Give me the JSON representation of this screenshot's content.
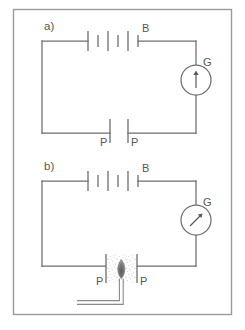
{
  "figure": {
    "type": "physics-circuit-diagram",
    "frame_color": "#9a9a9a",
    "wire_color": "#6e6e6e",
    "label_color": "#565656",
    "background": "#ffffff",
    "panels": [
      {
        "id": "a",
        "label": "a)",
        "battery": {
          "label": "B",
          "cells": 3
        },
        "galvanometer": {
          "label": "G",
          "needle_angle_deg": 0,
          "needle_state": "no-deflection"
        },
        "plates": [
          {
            "label": "P",
            "side": "left"
          },
          {
            "label": "P",
            "side": "right"
          }
        ],
        "gap_state": "air-gap-no-conduction",
        "flame": null
      },
      {
        "id": "b",
        "label": "b)",
        "battery": {
          "label": "B",
          "cells": 3
        },
        "galvanometer": {
          "label": "G",
          "needle_angle_deg": 45,
          "needle_state": "deflected"
        },
        "plates": [
          {
            "label": "P",
            "side": "left"
          },
          {
            "label": "P",
            "side": "right"
          }
        ],
        "gap_state": "ionized-gas-conducting",
        "flame": {
          "label": "flame",
          "burner": "l-shaped-tube"
        }
      }
    ],
    "caption": ""
  }
}
